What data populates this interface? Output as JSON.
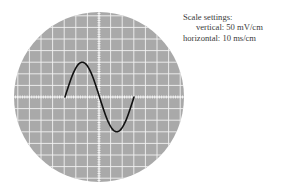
{
  "scale_settings": {
    "title": "Scale settings:",
    "vertical_label": "vertical:",
    "vertical_value": "50 mV/cm",
    "horizontal_label": "horizontal:",
    "horizontal_value": "10 ms/cm"
  },
  "screen": {
    "center_x": 99,
    "center_y": 97,
    "radius": 85,
    "grid_spacing_px": 11.6,
    "background_color": "#a9a9a9",
    "grid_color": "#f2f2f2",
    "trace_color": "#111111"
  },
  "trace": {
    "waveform": "sine",
    "cycles": 1,
    "start_x": 65,
    "end_x": 134,
    "amplitude_divisions": 3,
    "period_divisions": 6
  }
}
